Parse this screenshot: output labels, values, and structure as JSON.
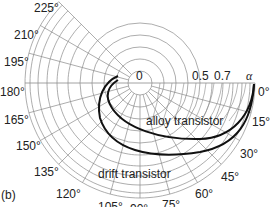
{
  "figure_label": "(b)",
  "center_label": "0",
  "radial_labels": [
    {
      "text": "0.5",
      "x": 192,
      "y": 81
    },
    {
      "text": "0.7",
      "x": 214,
      "y": 81
    }
  ],
  "alpha_symbol": "α",
  "angle_labels": [
    {
      "text": "0°",
      "x": 258,
      "y": 88
    },
    {
      "text": "15°",
      "x": 252,
      "y": 118
    },
    {
      "text": "30°",
      "x": 240,
      "y": 150
    },
    {
      "text": "45°",
      "x": 221,
      "y": 173
    },
    {
      "text": "60°",
      "x": 195,
      "y": 190
    },
    {
      "text": "75°",
      "x": 162,
      "y": 201
    },
    {
      "text": "90°",
      "x": 130,
      "y": 205
    },
    {
      "text": "105°",
      "x": 98,
      "y": 203
    },
    {
      "text": "120°",
      "x": 56,
      "y": 190
    },
    {
      "text": "135°",
      "x": 34,
      "y": 168
    },
    {
      "text": "150°",
      "x": 16,
      "y": 142
    },
    {
      "text": "165°",
      "x": 4,
      "y": 116
    },
    {
      "text": "180°",
      "x": 0,
      "y": 88
    },
    {
      "text": "195°",
      "x": 4,
      "y": 58
    },
    {
      "text": "210°",
      "x": 14,
      "y": 31
    },
    {
      "text": "225°",
      "x": 34,
      "y": 4
    }
  ],
  "curves": [
    {
      "name": "alloy transistor",
      "label_x": 146,
      "label_y": 125
    },
    {
      "name": "drift transistor",
      "label_x": 98,
      "label_y": 175
    }
  ],
  "colors": {
    "grid": "#8a8a8a",
    "curve": "#111111",
    "text": "#222222"
  }
}
